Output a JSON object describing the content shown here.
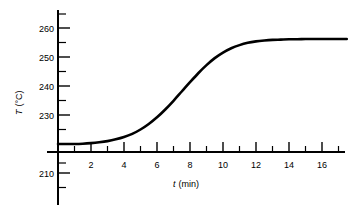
{
  "chart_data": {
    "type": "line",
    "title": "",
    "xlabel": "t (min)",
    "xlabel_symbol": "t",
    "xlabel_units": "(min)",
    "ylabel": "T (°C)",
    "ylabel_symbol": "T",
    "ylabel_units": "(°C)",
    "xlim": [
      0,
      17.6
    ],
    "ylim": [
      208,
      264
    ],
    "grid": false,
    "legend": null,
    "axis_crossing_temperature": 220,
    "x_major_ticks": [
      2,
      4,
      6,
      8,
      10,
      12,
      14,
      16
    ],
    "x_major_tick_labels": [
      "2",
      "4",
      "6",
      "8",
      "10",
      "12",
      "14",
      "16"
    ],
    "x_minor_ticks": [
      1,
      3,
      5,
      7,
      9,
      11,
      13,
      15,
      17
    ],
    "y_major_ticks": [
      210,
      220,
      230,
      240,
      250,
      260
    ],
    "y_major_tick_labels": [
      "210",
      "",
      "230",
      "240",
      "250",
      "260"
    ],
    "y_minor_ticks": [
      215,
      225,
      235,
      245,
      255
    ],
    "series": [
      {
        "name": "temperature",
        "color": "#000000",
        "x": [
          0.0,
          0.5,
          1.0,
          1.5,
          2.0,
          2.5,
          3.0,
          3.5,
          4.0,
          4.5,
          5.0,
          5.5,
          6.0,
          6.5,
          7.0,
          7.5,
          8.0,
          8.5,
          9.0,
          9.5,
          10.0,
          10.5,
          11.0,
          11.5,
          12.0,
          12.5,
          13.0,
          13.5,
          14.0,
          14.5,
          15.0,
          15.5,
          16.0,
          16.5,
          17.0,
          17.5
        ],
        "y": [
          220.0,
          220.0,
          220.0,
          220.1,
          220.3,
          220.6,
          221.0,
          221.6,
          222.4,
          223.5,
          225.0,
          226.9,
          229.2,
          231.9,
          234.9,
          238.1,
          241.3,
          244.4,
          247.2,
          249.6,
          251.5,
          253.0,
          254.1,
          254.9,
          255.4,
          255.7,
          255.9,
          256.0,
          256.1,
          256.1,
          256.2,
          256.2,
          256.2,
          256.2,
          256.2,
          256.2
        ]
      }
    ],
    "annotations": {
      "plateau_value": 256,
      "onset_time": 3,
      "inflection_time": 8.5
    }
  }
}
